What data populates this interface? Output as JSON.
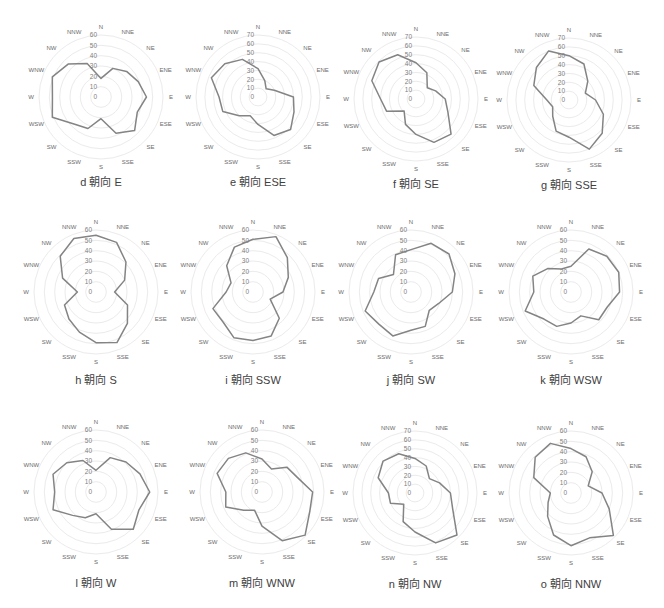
{
  "figure": {
    "directions": [
      "N",
      "NNE",
      "NE",
      "ENE",
      "E",
      "ESE",
      "SE",
      "SSE",
      "S",
      "SSW",
      "SW",
      "WSW",
      "W",
      "WNW",
      "NW",
      "NNW"
    ],
    "colors": {
      "series_line": "#848484",
      "grid_ring": "#ebebeb",
      "tick_label": "#808080",
      "category_label": "#6a6a6a",
      "caption": "#404040"
    }
  },
  "chart_data": [
    {
      "id": "d",
      "type": "radar",
      "title": "d 朝向 E",
      "categories": [
        "N",
        "NNE",
        "NE",
        "ENE",
        "E",
        "ESE",
        "SE",
        "SSE",
        "S",
        "SSW",
        "SW",
        "WSW",
        "W",
        "WNW",
        "NW",
        "NNW"
      ],
      "values": [
        18,
        30,
        35,
        39,
        44,
        38,
        46,
        38,
        21,
        33,
        37,
        51,
        47,
        51,
        45,
        35
      ],
      "rmax": 60,
      "ticks": [
        0,
        10,
        20,
        30,
        40,
        50,
        60
      ],
      "grid": "circular",
      "legend": "none"
    },
    {
      "id": "e",
      "type": "radar",
      "title": "e 朝向 ESE",
      "categories": [
        "N",
        "NNE",
        "NE",
        "ENE",
        "E",
        "ESE",
        "SE",
        "SSE",
        "S",
        "SSW",
        "SW",
        "WSW",
        "W",
        "WNW",
        "NW",
        "NNW"
      ],
      "values": [
        32,
        20,
        13,
        20,
        40,
        44,
        52,
        47,
        31,
        23,
        30,
        43,
        44,
        57,
        53,
        46
      ],
      "rmax": 70,
      "ticks": [
        0,
        10,
        20,
        30,
        40,
        50,
        60,
        70
      ],
      "grid": "circular",
      "legend": "none"
    },
    {
      "id": "f",
      "type": "radar",
      "title": "f 朝向 SE",
      "categories": [
        "N",
        "NNE",
        "NE",
        "ENE",
        "E",
        "ESE",
        "SE",
        "SSE",
        "S",
        "SSW",
        "SW",
        "WSW",
        "W",
        "WNW",
        "NW",
        "NNW"
      ],
      "values": [
        41,
        32,
        18,
        24,
        33,
        39,
        56,
        53,
        40,
        31,
        19,
        36,
        40,
        54,
        59,
        54
      ],
      "rmax": 70,
      "ticks": [
        0,
        10,
        20,
        30,
        40,
        50,
        60,
        70
      ],
      "grid": "circular",
      "legend": "none"
    },
    {
      "id": "g",
      "type": "radar",
      "title": "g 朝向 SSE",
      "categories": [
        "N",
        "NNE",
        "NE",
        "ENE",
        "E",
        "ESE",
        "SE",
        "SSE",
        "S",
        "SSW",
        "SW",
        "WSW",
        "W",
        "WNW",
        "NW",
        "NNW"
      ],
      "values": [
        50,
        44,
        30,
        20,
        30,
        42,
        53,
        60,
        42,
        38,
        26,
        20,
        25,
        43,
        52,
        60
      ],
      "rmax": 70,
      "ticks": [
        0,
        10,
        20,
        30,
        40,
        50,
        60,
        70
      ],
      "grid": "circular",
      "legend": "none"
    },
    {
      "id": "h",
      "type": "radar",
      "title": "h 朝向 S",
      "categories": [
        "N",
        "NNE",
        "NE",
        "ENE",
        "E",
        "ESE",
        "SE",
        "SSE",
        "S",
        "SSW",
        "SW",
        "WSW",
        "W",
        "WNW",
        "NW",
        "NNW"
      ],
      "values": [
        55,
        52,
        41,
        30,
        18,
        33,
        43,
        53,
        49,
        42,
        37,
        33,
        18,
        35,
        49,
        56
      ],
      "rmax": 60,
      "ticks": [
        0,
        10,
        20,
        30,
        40,
        50,
        60
      ],
      "grid": "circular",
      "legend": "none"
    },
    {
      "id": "i",
      "type": "radar",
      "title": "i 朝向 SSW",
      "categories": [
        "N",
        "NNE",
        "NE",
        "ENE",
        "E",
        "ESE",
        "SE",
        "SSE",
        "S",
        "SSW",
        "SW",
        "WSW",
        "W",
        "WNW",
        "NW",
        "NNW"
      ],
      "values": [
        51,
        58,
        47,
        37,
        29,
        18,
        36,
        46,
        47,
        48,
        41,
        42,
        26,
        23,
        36,
        47
      ],
      "rmax": 60,
      "ticks": [
        0,
        10,
        20,
        30,
        40,
        50,
        60
      ],
      "grid": "circular",
      "legend": "none"
    },
    {
      "id": "j",
      "type": "radar",
      "title": "j 朝向 SW",
      "categories": [
        "N",
        "NNE",
        "NE",
        "ENE",
        "E",
        "ESE",
        "SE",
        "SSE",
        "S",
        "SSW",
        "SW",
        "WSW",
        "W",
        "WNW",
        "NW",
        "NNW"
      ],
      "values": [
        41,
        51,
        52,
        46,
        40,
        29,
        25,
        36,
        37,
        46,
        44,
        48,
        36,
        34,
        24,
        39
      ],
      "rmax": 60,
      "ticks": [
        0,
        10,
        20,
        30,
        40,
        50,
        60
      ],
      "grid": "circular",
      "legend": "none"
    },
    {
      "id": "k",
      "type": "radar",
      "title": "k 朝向 WSW",
      "categories": [
        "N",
        "NNE",
        "NE",
        "ENE",
        "E",
        "ESE",
        "SE",
        "SSE",
        "S",
        "SSW",
        "SW",
        "WSW",
        "W",
        "WNW",
        "NW",
        "NNW"
      ],
      "values": [
        25,
        45,
        49,
        50,
        47,
        38,
        38,
        25,
        30,
        36,
        37,
        48,
        36,
        40,
        32,
        24
      ],
      "rmax": 60,
      "ticks": [
        0,
        10,
        20,
        30,
        40,
        50,
        60
      ],
      "grid": "circular",
      "legend": "none"
    },
    {
      "id": "l",
      "type": "radar",
      "title": "l 朝向 W",
      "categories": [
        "N",
        "NNE",
        "NE",
        "ENE",
        "E",
        "ESE",
        "SE",
        "SSE",
        "S",
        "SSW",
        "SW",
        "WSW",
        "W",
        "WNW",
        "NW",
        "NNW"
      ],
      "values": [
        21,
        36,
        41,
        46,
        52,
        45,
        51,
        39,
        21,
        27,
        32,
        45,
        40,
        45,
        40,
        33
      ],
      "rmax": 60,
      "ticks": [
        0,
        10,
        20,
        30,
        40,
        50,
        60
      ],
      "grid": "circular",
      "legend": "none"
    },
    {
      "id": "m",
      "type": "radar",
      "title": "m 朝向 WNW",
      "categories": [
        "N",
        "NNE",
        "NE",
        "ENE",
        "E",
        "ESE",
        "SE",
        "SSE",
        "S",
        "SSW",
        "SW",
        "WSW",
        "W",
        "WNW",
        "NW",
        "NNW"
      ],
      "values": [
        32,
        24,
        34,
        37,
        49,
        50,
        59,
        51,
        33,
        19,
        25,
        38,
        35,
        47,
        46,
        41
      ],
      "rmax": 60,
      "ticks": [
        0,
        10,
        20,
        30,
        40,
        50,
        60
      ],
      "grid": "circular",
      "legend": "none"
    },
    {
      "id": "n",
      "type": "radar",
      "title": "n 朝向 NW",
      "categories": [
        "N",
        "NNE",
        "NE",
        "ENE",
        "E",
        "ESE",
        "SE",
        "SSE",
        "S",
        "SSW",
        "SW",
        "WSW",
        "W",
        "WNW",
        "NW",
        "NNW"
      ],
      "values": [
        39,
        33,
        23,
        30,
        40,
        46,
        67,
        61,
        44,
        35,
        18,
        30,
        30,
        45,
        51,
        48
      ],
      "rmax": 70,
      "ticks": [
        0,
        10,
        20,
        30,
        40,
        50,
        60,
        70
      ],
      "grid": "circular",
      "legend": "none"
    },
    {
      "id": "o",
      "type": "radar",
      "title": "o 朝向 NNW",
      "categories": [
        "N",
        "NNE",
        "NE",
        "ENE",
        "E",
        "ESE",
        "SE",
        "SSE",
        "S",
        "SSW",
        "SW",
        "WSW",
        "W",
        "WNW",
        "NW",
        "NNW"
      ],
      "values": [
        43,
        38,
        29,
        18,
        30,
        40,
        58,
        47,
        51,
        44,
        32,
        24,
        20,
        39,
        49,
        52
      ],
      "rmax": 60,
      "ticks": [
        0,
        10,
        20,
        30,
        40,
        50,
        60
      ],
      "grid": "circular",
      "legend": "none"
    }
  ]
}
